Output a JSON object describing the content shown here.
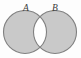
{
  "figure": {
    "kind": "venn-diagram",
    "background_color": "#fdfdfd",
    "width": 81,
    "height": 58
  },
  "sets": [
    {
      "id": "A",
      "label": "A",
      "label_x": 26,
      "label_y": 11,
      "center_x": 25,
      "center_y": 32,
      "radius": 21.5,
      "fill_color": "#c9c9c9",
      "stroke_color": "#808080"
    },
    {
      "id": "B",
      "label": "B",
      "label_x": 55,
      "label_y": 11,
      "center_x": 55,
      "center_y": 32,
      "radius": 21.5,
      "fill_color": "#c9c9c9",
      "stroke_color": "#808080"
    }
  ],
  "regions": {
    "intersection": {
      "name": "A-intersect-B",
      "fill_color": "#ffffff",
      "shaded": false
    },
    "a_only": {
      "name": "A-only",
      "fill_color": "#c9c9c9",
      "shaded": true
    },
    "b_only": {
      "name": "B-only",
      "fill_color": "#c9c9c9",
      "shaded": true
    }
  },
  "style": {
    "stroke_width": 1.1,
    "label_font_size": 9.5,
    "label_color": "#3a3a3a"
  }
}
